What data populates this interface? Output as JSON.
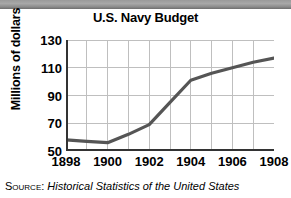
{
  "figure": {
    "title": "U.S. Navy Budget",
    "source_prefix": "Source:",
    "source_title": "Historical Statistics of the United States"
  },
  "chart_data": {
    "type": "line",
    "title": "U.S. Navy Budget",
    "xlabel": "",
    "ylabel": "Millions of dollars",
    "x": [
      1898,
      1899,
      1900,
      1901,
      1902,
      1903,
      1904,
      1905,
      1906,
      1907,
      1908
    ],
    "values": [
      58,
      57,
      56,
      62,
      69,
      85,
      101,
      106,
      110,
      114,
      117
    ],
    "labeled_points": {
      "x": [
        1898,
        1900,
        1902,
        1904,
        1906,
        1908
      ],
      "values": [
        58,
        56,
        69,
        101,
        110,
        117
      ]
    },
    "xticks": [
      "1898",
      "1900",
      "1902",
      "1904",
      "1906",
      "1908"
    ],
    "xtick_values": [
      1898,
      1900,
      1902,
      1904,
      1906,
      1908
    ],
    "yticks": [
      "50",
      "70",
      "90",
      "110",
      "130"
    ],
    "ytick_values": [
      50,
      70,
      90,
      110,
      130
    ],
    "xlim": [
      1898,
      1908
    ],
    "ylim": [
      50,
      130
    ],
    "grid": true,
    "grid_x_step": 1,
    "grid_y_step": 20,
    "legend": null,
    "line_color": "#555555",
    "grid_color": "#bfbfbf",
    "axis_color": "#333333"
  }
}
